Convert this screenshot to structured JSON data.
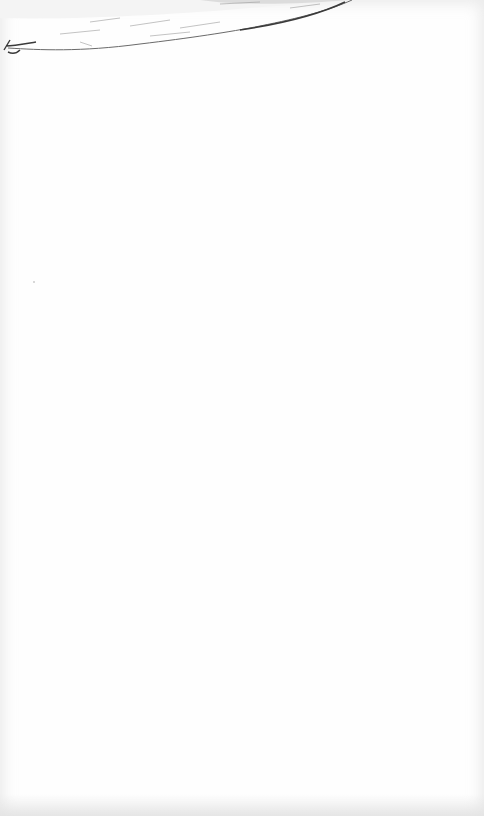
{
  "image": {
    "description": "Scanned sheet of white paper with a partial pencil sketch at the top edge",
    "subject": "pencil-sketch",
    "paper_color": "#fefefe",
    "stroke_color": "#3a3a3a"
  }
}
